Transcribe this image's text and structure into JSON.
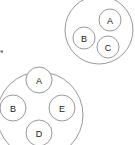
{
  "figure": {
    "kind": "nested-circle-diagram",
    "background_color": "#ffffff",
    "outline_color": "#8d8d8d",
    "label_color": "#1a1a1a",
    "width": 135,
    "height": 145
  },
  "groups": [
    {
      "id": "group-top-right",
      "name": "upper-right-cluster",
      "cx": 99,
      "cy": 30,
      "r": 34,
      "node_r": 11,
      "clipped": "top-right",
      "nodes": [
        {
          "id": "node-tr-a",
          "label": "A",
          "cx": 110,
          "cy": 20
        },
        {
          "id": "node-tr-b",
          "label": "B",
          "cx": 84,
          "cy": 38
        },
        {
          "id": "node-tr-c",
          "label": "C",
          "cx": 108,
          "cy": 47
        }
      ]
    },
    {
      "id": "group-bottom-left",
      "name": "lower-left-cluster",
      "cx": 40,
      "cy": 115,
      "r": 43,
      "node_r": 13,
      "clipped": "left-bottom",
      "nodes": [
        {
          "id": "node-bl-a",
          "label": "A",
          "cx": 39,
          "cy": 80
        },
        {
          "id": "node-bl-b",
          "label": "B",
          "cx": 13,
          "cy": 108
        },
        {
          "id": "node-bl-e",
          "label": "E",
          "cx": 62,
          "cy": 108
        },
        {
          "id": "node-bl-d",
          "label": "D",
          "cx": 39,
          "cy": 133
        }
      ]
    }
  ],
  "marks": [
    {
      "id": "stray-mark-left",
      "x": 0.5,
      "y": 50.5,
      "w": 2.5,
      "h": 2.0
    }
  ]
}
